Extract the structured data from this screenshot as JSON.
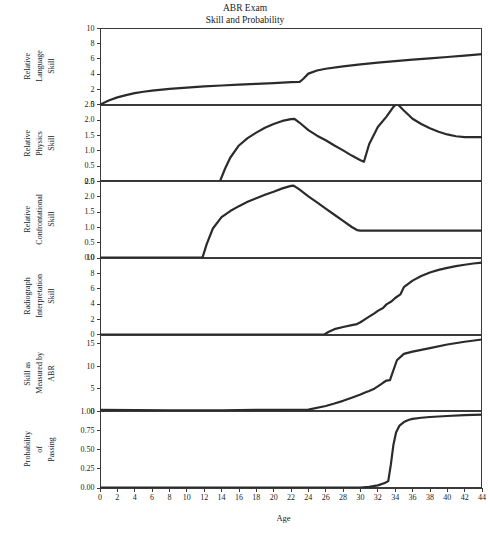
{
  "title": {
    "line1": "ABR Exam",
    "line2": "Skill and Probability"
  },
  "xaxis": {
    "label": "Age",
    "ticks": [
      0,
      2,
      4,
      6,
      8,
      10,
      12,
      14,
      16,
      18,
      20,
      22,
      24,
      26,
      28,
      30,
      32,
      34,
      36,
      38,
      40,
      42,
      44
    ],
    "min": 0,
    "max": 44
  },
  "style": {
    "line_color": "#2b2b2b",
    "frame_color": "#3a3a3a",
    "background": "#ffffff"
  },
  "chart_data": [
    {
      "type": "line",
      "title": "ABR Exam",
      "subtitle": "Skill and Probability",
      "panel_index": 0,
      "ylabel_lines": [
        "Relative",
        "Language",
        "Skill"
      ],
      "xlabel": "Age",
      "xlim": [
        0,
        44
      ],
      "ylim": [
        0,
        10
      ],
      "yticks": [
        0,
        2,
        4,
        6,
        8,
        10
      ],
      "ytick_labels": [
        "0",
        "2",
        "4",
        "6",
        "8",
        "10"
      ],
      "grid": false,
      "legend": null,
      "x": [
        0,
        1,
        2,
        3,
        4,
        5,
        6,
        8,
        10,
        12,
        14,
        16,
        18,
        20,
        22,
        23,
        23.4,
        24,
        25,
        26,
        28,
        30,
        32,
        34,
        36,
        38,
        40,
        42,
        44
      ],
      "y": [
        0,
        0.55,
        0.95,
        1.25,
        1.5,
        1.68,
        1.83,
        2.05,
        2.22,
        2.38,
        2.5,
        2.62,
        2.72,
        2.82,
        2.93,
        2.97,
        3.35,
        4.05,
        4.45,
        4.68,
        5.0,
        5.26,
        5.48,
        5.68,
        5.87,
        6.05,
        6.22,
        6.4,
        6.6
      ]
    },
    {
      "type": "line",
      "panel_index": 1,
      "ylabel_lines": [
        "Relative",
        "Physics",
        "Skill"
      ],
      "xlabel": "Age",
      "xlim": [
        0,
        44
      ],
      "ylim": [
        0.0,
        2.5
      ],
      "yticks": [
        0.0,
        0.5,
        1.0,
        1.5,
        2.0,
        2.5
      ],
      "ytick_labels": [
        "0.0",
        "0.5",
        "1.0",
        "1.5",
        "2.0",
        "2.5"
      ],
      "grid": false,
      "legend": null,
      "x": [
        0,
        4,
        8,
        12,
        13.8,
        14.4,
        15,
        16,
        17,
        18,
        19,
        20,
        21,
        22,
        22.4,
        23,
        24,
        25,
        26,
        27,
        28,
        29,
        30,
        30.4,
        31,
        32,
        33,
        33.8,
        34.2,
        35,
        36,
        37,
        38,
        39,
        40,
        41,
        42,
        44
      ],
      "y": [
        0,
        0,
        0,
        0,
        0.0,
        0.42,
        0.78,
        1.18,
        1.42,
        1.6,
        1.76,
        1.88,
        1.98,
        2.04,
        2.05,
        1.92,
        1.68,
        1.5,
        1.35,
        1.18,
        1.02,
        0.85,
        0.7,
        0.65,
        1.22,
        1.78,
        2.12,
        2.44,
        2.55,
        2.32,
        2.05,
        1.88,
        1.74,
        1.63,
        1.54,
        1.48,
        1.45,
        1.45
      ]
    },
    {
      "type": "line",
      "panel_index": 2,
      "ylabel_lines": [
        "Relative",
        "Confrontational",
        "Skill"
      ],
      "xlabel": "Age",
      "xlim": [
        0,
        44
      ],
      "ylim": [
        0.0,
        2.5
      ],
      "yticks": [
        0.0,
        0.5,
        1.0,
        1.5,
        2.0,
        2.5
      ],
      "ytick_labels": [
        "0.0",
        "0.5",
        "1.0",
        "1.5",
        "2.0",
        "2.5"
      ],
      "grid": false,
      "legend": null,
      "x": [
        0,
        4,
        8,
        11.8,
        12.3,
        13,
        14,
        15,
        16,
        17,
        18,
        19,
        20,
        21,
        22,
        22.3,
        23,
        24,
        25,
        26,
        27,
        28,
        29,
        29.6,
        30,
        32,
        34,
        36,
        38,
        40,
        42,
        44
      ],
      "y": [
        0,
        0,
        0,
        0.0,
        0.45,
        0.95,
        1.32,
        1.52,
        1.68,
        1.82,
        1.94,
        2.05,
        2.15,
        2.26,
        2.34,
        2.35,
        2.22,
        2.0,
        1.8,
        1.6,
        1.4,
        1.2,
        1.0,
        0.9,
        0.88,
        0.88,
        0.88,
        0.88,
        0.88,
        0.88,
        0.88,
        0.88
      ]
    },
    {
      "type": "line",
      "panel_index": 3,
      "ylabel_lines": [
        "Radiograph",
        "Interpretation",
        "Skill"
      ],
      "xlabel": "Age",
      "xlim": [
        0,
        44
      ],
      "ylim": [
        0,
        10
      ],
      "yticks": [
        0,
        2,
        4,
        6,
        8,
        10
      ],
      "ytick_labels": [
        "0",
        "2",
        "4",
        "6",
        "8",
        "10"
      ],
      "grid": false,
      "legend": null,
      "x": [
        0,
        6,
        12,
        18,
        24,
        25.8,
        26.3,
        27,
        28,
        29,
        29.6,
        30,
        30.6,
        31,
        31.6,
        32,
        32.6,
        33,
        33.6,
        34,
        34.6,
        35,
        36,
        37,
        38,
        39,
        40,
        41,
        42,
        43,
        44
      ],
      "y": [
        0,
        0,
        0,
        0,
        0,
        0.0,
        0.35,
        0.72,
        1.0,
        1.25,
        1.38,
        1.62,
        2.05,
        2.35,
        2.78,
        3.1,
        3.48,
        3.95,
        4.35,
        4.78,
        5.25,
        6.2,
        7.05,
        7.65,
        8.1,
        8.45,
        8.72,
        8.95,
        9.12,
        9.28,
        9.4
      ]
    },
    {
      "type": "line",
      "panel_index": 4,
      "ylabel_lines": [
        "Skill as",
        "Measured by",
        "ABR"
      ],
      "xlabel": "Age",
      "xlim": [
        0,
        44
      ],
      "ylim": [
        0,
        17
      ],
      "yticks": [
        0,
        5,
        10,
        15
      ],
      "ytick_labels": [
        "0",
        "5",
        "10",
        "15"
      ],
      "grid": false,
      "legend": null,
      "x": [
        0,
        4,
        8,
        12,
        14,
        16,
        18,
        20,
        22,
        24,
        26,
        27,
        28,
        29,
        30,
        30.6,
        31,
        31.6,
        32,
        32.6,
        33,
        33.4,
        33.8,
        34.2,
        35,
        36,
        37,
        38,
        40,
        42,
        44
      ],
      "y": [
        0.4,
        0.35,
        0.3,
        0.28,
        0.3,
        0.35,
        0.38,
        0.4,
        0.42,
        0.45,
        1.25,
        1.8,
        2.4,
        3.1,
        3.8,
        4.3,
        4.6,
        5.1,
        5.6,
        6.4,
        6.9,
        7.0,
        9.2,
        11.4,
        12.8,
        13.3,
        13.7,
        14.1,
        14.9,
        15.5,
        16.0
      ]
    },
    {
      "type": "line",
      "panel_index": 5,
      "ylabel_lines": [
        "Probability",
        "of",
        "Passing"
      ],
      "xlabel": "Age",
      "xlim": [
        0,
        44
      ],
      "ylim": [
        0.0,
        1.0
      ],
      "yticks": [
        0.0,
        0.25,
        0.5,
        0.75,
        1.0
      ],
      "ytick_labels": [
        "0.00",
        "0.25",
        "0.50",
        "0.75",
        "1.00"
      ],
      "grid": false,
      "legend": null,
      "x": [
        0,
        6,
        12,
        18,
        24,
        28,
        30,
        31,
        32,
        32.8,
        33.2,
        33.5,
        33.8,
        34.1,
        34.5,
        35,
        35.6,
        36,
        37,
        38,
        40,
        42,
        44
      ],
      "y": [
        0.0,
        0.0,
        0.0,
        0.0,
        0.0,
        0.0,
        0.0,
        0.01,
        0.03,
        0.06,
        0.085,
        0.3,
        0.56,
        0.72,
        0.81,
        0.855,
        0.885,
        0.898,
        0.912,
        0.922,
        0.935,
        0.945,
        0.952
      ]
    }
  ],
  "panels": [
    {
      "id": "relative-language-skill"
    },
    {
      "id": "relative-physics-skill"
    },
    {
      "id": "relative-confrontational-skill"
    },
    {
      "id": "radiograph-interpretation-skill"
    },
    {
      "id": "skill-as-measured-by-abr"
    },
    {
      "id": "probability-of-passing"
    }
  ]
}
